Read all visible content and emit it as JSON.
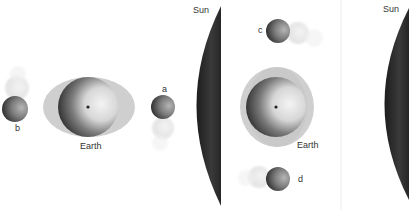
{
  "diagram": {
    "colors": {
      "background": "#ffffff",
      "sun": "#2e2e2e",
      "bulge": "#c8c8c8",
      "earth_dark": "#222222",
      "earth_light": "#efefef",
      "divider": "#ececec"
    },
    "panels": [
      {
        "id": "left",
        "labels": {
          "earth": "Earth",
          "sun": "Sun",
          "moon_a": "a",
          "moon_b": "b"
        },
        "bulge_orientation": "horizontal"
      },
      {
        "id": "middle",
        "labels": {
          "earth": "Earth",
          "moon_c": "c",
          "moon_d": "d"
        },
        "bulge_orientation": "vertical"
      },
      {
        "id": "right",
        "labels": {
          "sun": "Sun"
        }
      }
    ]
  }
}
